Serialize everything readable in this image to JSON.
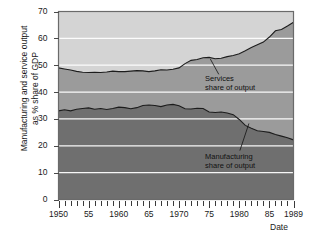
{
  "chart_data": {
    "type": "area",
    "title": "",
    "subtitle": "",
    "xlabel": "Date",
    "ylabel": "Manufacturing and service output\nas % share of GDP",
    "xlim": [
      1950,
      1989
    ],
    "ylim": [
      0,
      70
    ],
    "grid": true,
    "grid_color": "#ffffff",
    "legend": "annotations-inline",
    "y_ticks": [
      0,
      10,
      20,
      30,
      40,
      50,
      60,
      70
    ],
    "y_tick_labels": [
      "0",
      "10",
      "20",
      "30",
      "40",
      "50",
      "60",
      "70"
    ],
    "x_ticks": [
      1950,
      1955,
      1960,
      1965,
      1970,
      1975,
      1980,
      1985,
      1989
    ],
    "x_tick_labels": [
      "1950",
      "55",
      "1960",
      "65",
      "1970",
      "75",
      "1980",
      "85",
      "1989"
    ],
    "x_minor_tick_interval": 1,
    "annotations": [
      {
        "name": "services-annotation",
        "text": "Services\nshare of output",
        "x": 1974,
        "y": 45
      },
      {
        "name": "manufacturing-annotation",
        "text": "Manufacturing\nshare of output",
        "x": 1974,
        "y": 16
      }
    ],
    "series": [
      {
        "name": "Services share of output",
        "color": "#9b9b9b",
        "x": [
          1950,
          1951,
          1952,
          1953,
          1954,
          1955,
          1956,
          1957,
          1958,
          1959,
          1960,
          1961,
          1962,
          1963,
          1964,
          1965,
          1966,
          1967,
          1968,
          1969,
          1970,
          1971,
          1972,
          1973,
          1974,
          1975,
          1976,
          1977,
          1978,
          1979,
          1980,
          1981,
          1982,
          1983,
          1984,
          1985,
          1986,
          1987,
          1988,
          1989
        ],
        "values": [
          49.0,
          48.6,
          48.2,
          47.7,
          47.4,
          47.3,
          47.4,
          47.3,
          47.5,
          47.8,
          47.6,
          47.6,
          47.8,
          48.0,
          47.9,
          47.6,
          47.9,
          48.3,
          48.2,
          48.5,
          49.0,
          50.6,
          51.8,
          52.1,
          52.8,
          52.9,
          52.4,
          52.6,
          53.2,
          53.6,
          54.3,
          55.4,
          56.6,
          57.6,
          58.6,
          60.5,
          62.8,
          63.3,
          64.6,
          66.0
        ]
      },
      {
        "name": "Manufacturing share of output",
        "color": "#6f6f6f",
        "x": [
          1950,
          1951,
          1952,
          1953,
          1954,
          1955,
          1956,
          1957,
          1958,
          1959,
          1960,
          1961,
          1962,
          1963,
          1964,
          1965,
          1966,
          1967,
          1968,
          1969,
          1970,
          1971,
          1972,
          1973,
          1974,
          1975,
          1976,
          1977,
          1978,
          1979,
          1980,
          1981,
          1982,
          1983,
          1984,
          1985,
          1986,
          1987,
          1988,
          1989
        ],
        "values": [
          33.0,
          33.4,
          33.0,
          33.6,
          33.9,
          34.1,
          33.6,
          33.9,
          33.5,
          33.9,
          34.4,
          34.2,
          33.8,
          34.2,
          35.0,
          35.2,
          35.0,
          34.6,
          35.2,
          35.4,
          34.9,
          33.8,
          33.7,
          34.0,
          33.9,
          32.6,
          32.4,
          32.6,
          32.2,
          31.6,
          29.8,
          27.6,
          26.5,
          25.6,
          25.3,
          25.0,
          24.2,
          23.6,
          23.0,
          22.2
        ]
      }
    ],
    "band_colors": {
      "above_services": "#d4d4d4",
      "services_band": "#9b9b9b",
      "manufacturing_band": "#6f6f6f"
    },
    "plot_border_color": "#6a6a6a",
    "background": "#ffffff"
  }
}
